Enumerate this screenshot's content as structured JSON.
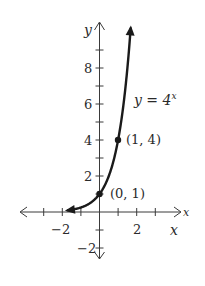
{
  "chart_data": {
    "type": "line",
    "title": "",
    "function": "y = 4^x",
    "series": [
      {
        "name": "y = 4^x",
        "x": [
          -1.75,
          -1.5,
          -1,
          -0.5,
          0,
          0.5,
          1,
          1.25,
          1.5,
          1.6
        ],
        "values": [
          0.088,
          0.125,
          0.25,
          0.5,
          1,
          2,
          4,
          5.66,
          8,
          9.19
        ]
      }
    ],
    "highlighted_points": [
      {
        "x": 0,
        "y": 1,
        "label": "(0, 1)"
      },
      {
        "x": 1,
        "y": 4,
        "label": "(1, 4)"
      }
    ],
    "curve_label": {
      "base": "y = 4",
      "exponent": "x"
    },
    "xlabel": "x",
    "ylabel": "y",
    "xlim": [
      -4.3,
      4.3
    ],
    "ylim": [
      -2.5,
      10.4
    ],
    "x_ticks": [
      -3,
      -2,
      -1,
      1,
      2,
      3
    ],
    "x_tick_labels": [
      {
        "value": -2,
        "text": "−2"
      },
      {
        "value": 2,
        "text": "2"
      }
    ],
    "y_ticks": [
      -2,
      -1,
      1,
      2,
      3,
      4,
      5,
      6,
      7,
      8,
      9
    ],
    "y_tick_labels": [
      {
        "value": 8,
        "text": "8"
      },
      {
        "value": 6,
        "text": "6"
      },
      {
        "value": 4,
        "text": "4"
      },
      {
        "value": 2,
        "text": "2"
      },
      {
        "value": -2,
        "text": "−2"
      }
    ],
    "grid": false,
    "legend": "none"
  },
  "labels": {
    "y_axis": "y",
    "x_axis_end": "x",
    "x_axis_below": "x",
    "curve_base": "y = 4",
    "curve_exp": "x",
    "point_0_1": "(0, 1)",
    "point_1_4": "(1, 4)",
    "xtick_neg2": "−2",
    "xtick_2": "2",
    "ytick_8": "8",
    "ytick_6": "6",
    "ytick_4": "4",
    "ytick_2": "2",
    "ytick_neg2": "−2"
  }
}
